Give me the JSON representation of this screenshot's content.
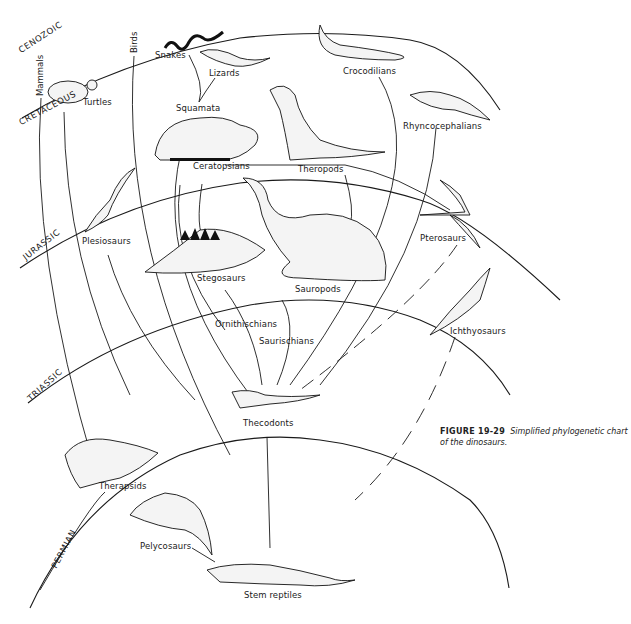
{
  "figure": {
    "number": "FIGURE 19-29",
    "caption": "Simplified phylogenetic chart of the dinosaurs."
  },
  "eras": {
    "cenozoic": "CENOZOIC",
    "cretaceous": "CRETACEOUS",
    "jurassic": "JURASSIC",
    "triassic": "TRIASSIC",
    "permian": "PERMIAN"
  },
  "groups": {
    "mammals": "Mammals",
    "birds": "Birds",
    "turtles": "Turtles",
    "snakes": "Snakes",
    "lizards": "Lizards",
    "squamata": "Squamata",
    "crocodilians": "Crocodilians",
    "rhyncocephalians": "Rhyncocephalians",
    "ceratopsians": "Ceratopsians",
    "theropods": "Theropods",
    "plesiosaurs": "Plesiosaurs",
    "stegosaurs": "Stegosaurs",
    "sauropods": "Sauropods",
    "pterosaurs": "Pterosaurs",
    "ichthyosaurs": "Ichthyosaurs",
    "ornithischians": "Ornithischians",
    "saurischians": "Saurischians",
    "thecodonts": "Thecodonts",
    "therapsids": "Therapsids",
    "pelycosaurs": "Pelycosaurs",
    "stem_reptiles": "Stem reptiles"
  }
}
